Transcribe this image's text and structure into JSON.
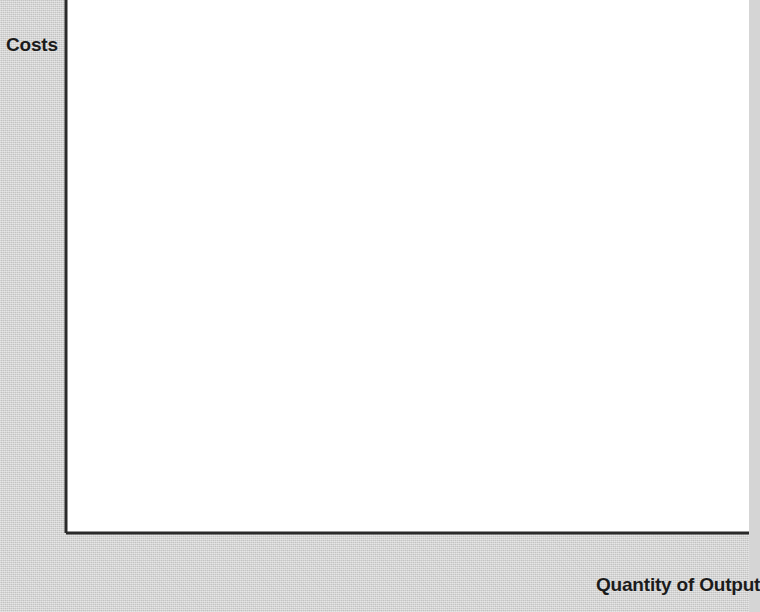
{
  "figure": {
    "background_color": "#d3d3d2",
    "plot_background_color": "#ffffff"
  },
  "axis": {
    "y_title": "Costs",
    "x_title": "Quantity of Output"
  },
  "chart_data": {
    "type": "line",
    "title": "",
    "subtitle": "",
    "xlabel": "Quantity of Output",
    "ylabel": "Costs",
    "xlim": [
      0,
      14.6
    ],
    "ylim": [
      0,
      3.45
    ],
    "grid": false,
    "legend_position": "right-inline-labels",
    "x_ticks": [
      0,
      2,
      4,
      6,
      8,
      10,
      12,
      14
    ],
    "x_tick_labels": [
      "0",
      "2",
      "4",
      "6",
      "8",
      "10",
      "12",
      "14"
    ],
    "x_minor_ticks": [
      1,
      3,
      5,
      7,
      9,
      11,
      13
    ],
    "y_ticks": [
      0.5,
      1.0,
      1.5,
      2.0,
      2.5,
      3.0
    ],
    "y_tick_labels": [
      "0.50",
      "1.00",
      "1.50",
      "2.00",
      "2.50",
      "$3.00"
    ],
    "y_minor_ticks": [
      0.25,
      0.75,
      1.25,
      1.75,
      2.25,
      2.75
    ],
    "series": [
      {
        "name": "MC",
        "label": "MC",
        "color": "#231f20",
        "line_width": 4.2,
        "points": [
          [
            0.0,
            1.0
          ],
          [
            0.5,
            0.84
          ],
          [
            1.0,
            0.71
          ],
          [
            1.5,
            0.6
          ],
          [
            2.0,
            0.52
          ],
          [
            2.5,
            0.46
          ],
          [
            3.0,
            0.41
          ],
          [
            3.4,
            0.392
          ],
          [
            3.7,
            0.388
          ],
          [
            4.0,
            0.4
          ],
          [
            4.5,
            0.48
          ],
          [
            5.0,
            0.58
          ],
          [
            5.5,
            0.69
          ],
          [
            6.0,
            0.79
          ],
          [
            6.5,
            0.88
          ],
          [
            7.0,
            0.97
          ],
          [
            8.0,
            1.16
          ],
          [
            9.0,
            1.34
          ],
          [
            10.0,
            1.52
          ],
          [
            11.0,
            1.7
          ],
          [
            12.0,
            1.87
          ],
          [
            13.0,
            2.05
          ],
          [
            13.8,
            2.2
          ]
        ]
      },
      {
        "name": "ATC",
        "label": "ATC",
        "color": "#2b86c6",
        "line_width": 4.6,
        "points": [
          [
            0.95,
            3.0
          ],
          [
            1.2,
            2.63
          ],
          [
            1.5,
            2.28
          ],
          [
            1.8,
            2.02
          ],
          [
            2.1,
            1.81
          ],
          [
            2.5,
            1.6
          ],
          [
            3.0,
            1.41
          ],
          [
            3.5,
            1.27
          ],
          [
            4.0,
            1.17
          ],
          [
            4.5,
            1.09
          ],
          [
            5.0,
            1.03
          ],
          [
            5.5,
            0.99
          ],
          [
            6.0,
            0.965
          ],
          [
            6.5,
            0.95
          ],
          [
            7.0,
            0.948
          ],
          [
            7.5,
            0.952
          ],
          [
            8.0,
            0.965
          ],
          [
            9.0,
            1.0
          ],
          [
            10.0,
            1.05
          ],
          [
            11.0,
            1.11
          ],
          [
            12.0,
            1.17
          ],
          [
            13.0,
            1.23
          ],
          [
            13.8,
            1.28
          ]
        ]
      },
      {
        "name": "AVC",
        "label": "AVC",
        "color": "#2b86c6",
        "line_width": 4.6,
        "points": [
          [
            0.95,
            2.0
          ],
          [
            1.2,
            1.72
          ],
          [
            1.5,
            1.46
          ],
          [
            1.8,
            1.27
          ],
          [
            2.1,
            1.13
          ],
          [
            2.5,
            0.99
          ],
          [
            3.0,
            0.87
          ],
          [
            3.5,
            0.79
          ],
          [
            4.0,
            0.735
          ],
          [
            4.5,
            0.695
          ],
          [
            5.0,
            0.672
          ],
          [
            5.5,
            0.66
          ],
          [
            6.0,
            0.658
          ],
          [
            6.5,
            0.665
          ],
          [
            7.0,
            0.68
          ],
          [
            7.5,
            0.7
          ],
          [
            8.0,
            0.725
          ],
          [
            9.0,
            0.785
          ],
          [
            10.0,
            0.855
          ],
          [
            11.0,
            0.925
          ],
          [
            12.0,
            0.995
          ],
          [
            13.0,
            1.065
          ],
          [
            13.8,
            1.13
          ]
        ]
      },
      {
        "name": "AFC",
        "label": "AFC",
        "color": "#2b86c6",
        "line_width": 4.6,
        "points": [
          [
            0.95,
            1.02
          ],
          [
            1.2,
            0.98
          ],
          [
            1.5,
            0.93
          ],
          [
            2.0,
            0.855
          ],
          [
            2.5,
            0.79
          ],
          [
            3.0,
            0.725
          ],
          [
            3.5,
            0.665
          ],
          [
            4.0,
            0.61
          ],
          [
            4.5,
            0.56
          ],
          [
            5.0,
            0.515
          ],
          [
            5.5,
            0.475
          ],
          [
            6.0,
            0.44
          ],
          [
            6.5,
            0.405
          ],
          [
            7.0,
            0.375
          ],
          [
            7.5,
            0.35
          ],
          [
            8.0,
            0.325
          ],
          [
            9.0,
            0.285
          ],
          [
            10.0,
            0.252
          ],
          [
            11.0,
            0.225
          ],
          [
            12.0,
            0.202
          ],
          [
            13.0,
            0.178
          ],
          [
            13.8,
            0.158
          ]
        ]
      }
    ],
    "curve_labels": [
      {
        "text": "MC",
        "x": 685,
        "y": 211
      },
      {
        "text": "ATC",
        "x": 685,
        "y": 341
      },
      {
        "text": "AVC",
        "x": 685,
        "y": 364
      },
      {
        "text": "AFC",
        "x": 690,
        "y": 494
      }
    ],
    "annotations": [
      {
        "text": "MC intersects AVC at AVC minimum",
        "x": 5.5,
        "y": 0.66
      },
      {
        "text": "MC intersects ATC at ATC minimum",
        "x": 7.0,
        "y": 0.95
      }
    ]
  }
}
